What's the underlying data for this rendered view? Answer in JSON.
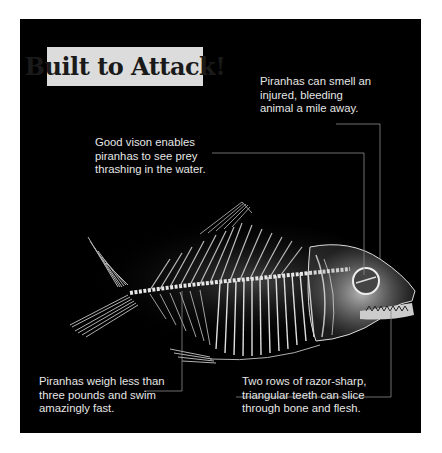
{
  "title": "Built to Attack!",
  "callouts": {
    "smell": [
      "Piranhas can smell an",
      "injured, bleeding",
      "animal a mile away."
    ],
    "vision": [
      "Good vison enables",
      "piranhas to see prey",
      "thrashing in the water."
    ],
    "weight": [
      "Piranhas weigh less than",
      "three pounds and swim",
      "amazingly fast."
    ],
    "teeth": [
      "Two rows of razor-sharp,",
      "triangular teeth can slice",
      "through bone and flesh."
    ]
  },
  "illustration": {
    "subject": "piranha-skeleton-xray",
    "background_color": "#000000",
    "title_box_color": "#dcdcdc"
  }
}
